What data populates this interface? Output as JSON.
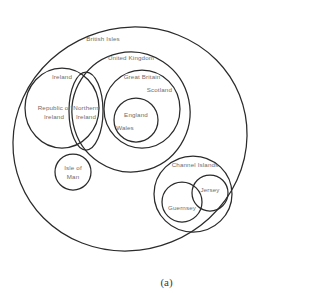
{
  "figure": {
    "caption": "(a)"
  },
  "colors": {
    "outline": "#2b2b2b",
    "label": "#6d6d6d",
    "background": "#ffffff",
    "caption": "#3a3a3a"
  },
  "regions": {
    "british_isles": {
      "label": "British Isles",
      "shape": "ellipse",
      "cx": 130,
      "cy": 139,
      "rx": 118,
      "ry": 111,
      "rotate": -22,
      "label_x": 103,
      "label_y": 41
    },
    "united_kingdom": {
      "label": "United Kingdom",
      "shape": "ellipse",
      "cx": 131,
      "cy": 112,
      "rx": 59,
      "ry": 60,
      "rotate": -12,
      "label_x": 131,
      "label_y": 60
    },
    "ireland": {
      "label": "Ireland",
      "shape": "ellipse",
      "cx": 62,
      "cy": 108,
      "rx": 37,
      "ry": 40,
      "rotate": 0,
      "label_x": 62,
      "label_y": 79
    },
    "republic_of_ireland": {
      "label_line1": "Republic of",
      "label_line2": "Ireland",
      "label_x": 54,
      "label_y": 110
    },
    "northern_ireland": {
      "label_line1": "Northern",
      "label_line2": "Ireland",
      "shape": "ellipse",
      "cx": 86,
      "cy": 111,
      "rx": 17,
      "ry": 39,
      "rotate": 0,
      "label_x": 86,
      "label_y": 110
    },
    "great_britain": {
      "label": "Great Britain",
      "shape": "ellipse",
      "cx": 142,
      "cy": 109,
      "rx": 38,
      "ry": 39,
      "rotate": 0,
      "label_x": 142,
      "label_y": 79
    },
    "scotland": {
      "label": "Scotland",
      "label_x": 172,
      "label_y": 92
    },
    "england_wales": {
      "shape": "ellipse",
      "cx": 136,
      "cy": 120,
      "rx": 22,
      "ry": 22,
      "rotate": 0
    },
    "england": {
      "label": "England",
      "label_x": 136,
      "label_y": 117
    },
    "wales": {
      "label": "Wales",
      "label_x": 125,
      "label_y": 130
    },
    "isle_of_man": {
      "label_line1": "Isle of",
      "label_line2": "Man",
      "shape": "circle",
      "cx": 73,
      "cy": 172,
      "r": 18,
      "label_x": 73,
      "label_y": 170
    },
    "channel_islands": {
      "label": "Channel Islands",
      "shape": "ellipse",
      "cx": 193,
      "cy": 194,
      "rx": 39,
      "ry": 38,
      "rotate": 0,
      "label_x": 195,
      "label_y": 167
    },
    "guernsey": {
      "label": "Guernsey",
      "shape": "circle",
      "cx": 182,
      "cy": 202,
      "r": 20,
      "label_x": 182,
      "label_y": 210
    },
    "jersey": {
      "label": "Jersey",
      "shape": "circle",
      "cx": 210,
      "cy": 193,
      "r": 18,
      "label_x": 210,
      "label_y": 192
    }
  }
}
